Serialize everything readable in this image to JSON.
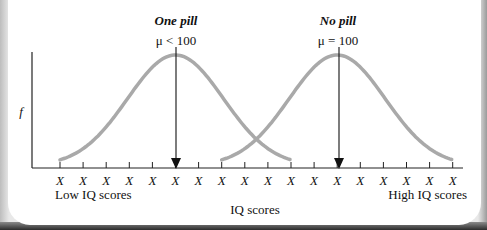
{
  "chart_data": {
    "type": "line",
    "title": "",
    "xlabel": "IQ scores",
    "ylabel": "f",
    "x_tick_labels": [
      "X",
      "X",
      "X",
      "X",
      "X",
      "X",
      "X",
      "X",
      "X",
      "X",
      "X",
      "X",
      "X",
      "X",
      "X",
      "X",
      "X",
      "X"
    ],
    "x_end_labels": {
      "left": "Low IQ scores",
      "right": "High IQ scores"
    },
    "series": [
      {
        "name": "One pill",
        "annotation": "μ < 100",
        "mean_tick_index": 5,
        "shape": "normal",
        "x_range_tick_index": [
          0,
          10
        ]
      },
      {
        "name": "No pill",
        "annotation": "μ = 100",
        "mean_tick_index": 12,
        "shape": "normal",
        "x_range_tick_index": [
          7,
          17
        ]
      }
    ],
    "grid": false,
    "legend": "none",
    "colors": {
      "curve": "#a9a9a9",
      "axis": "#222222",
      "arrow": "#111111"
    }
  },
  "labels": {
    "one_pill": "One pill",
    "one_pill_mu": "μ < 100",
    "no_pill": "No pill",
    "no_pill_mu": "μ = 100",
    "y_axis": "f",
    "x_axis": "IQ scores",
    "low": "Low IQ scores",
    "high": "High IQ scores",
    "tick": "X"
  }
}
